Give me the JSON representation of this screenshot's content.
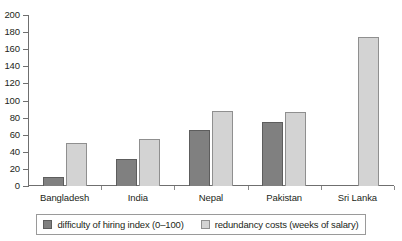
{
  "chart_data": {
    "type": "bar",
    "title": "",
    "xlabel": "",
    "ylabel": "",
    "ylim": [
      0,
      200
    ],
    "yticks": [
      0,
      20,
      40,
      60,
      80,
      100,
      120,
      140,
      160,
      180,
      200
    ],
    "grid": false,
    "legend_position": "bottom",
    "categories": [
      "Bangladesh",
      "India",
      "Nepal",
      "Pakistan",
      "Sri Lanka"
    ],
    "series": [
      {
        "name": "difficulty of hiring index (0–100)",
        "color": "#808080",
        "values": [
          11,
          32,
          65,
          75,
          0
        ]
      },
      {
        "name": "redundancy costs (weeks of salary)",
        "color": "#d3d3d3",
        "values": [
          50,
          55,
          88,
          86,
          174
        ]
      }
    ]
  },
  "axis": {
    "y_labels": [
      "200",
      "180",
      "160",
      "140",
      "120",
      "100",
      "80",
      "60",
      "40",
      "20",
      "0"
    ],
    "x_labels": [
      "Bangladesh",
      "India",
      "Nepal",
      "Pakistan",
      "Sri Lanka"
    ]
  },
  "legend": {
    "items": [
      {
        "label": "difficulty of hiring index (0–100)",
        "swatch": "series-0"
      },
      {
        "label": "redundancy costs (weeks of salary)",
        "swatch": "series-1"
      }
    ]
  },
  "title_remnant": ""
}
